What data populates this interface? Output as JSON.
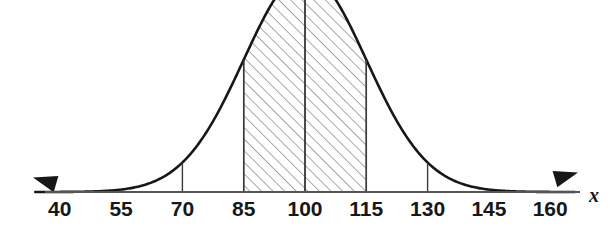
{
  "figure": {
    "kind": "normal-distribution-curve",
    "axis_label": "x",
    "colors": {
      "curve": "#171717",
      "axis": "#555555",
      "tick": "#3a3a3a",
      "hatch": "#9a9a9a",
      "shade_fill": "#ffffff",
      "background": "#ffffff"
    }
  },
  "chart_data": {
    "type": "line",
    "title": "",
    "subtitle": "",
    "xlabel": "x",
    "ylabel": "",
    "grid": false,
    "legend": null,
    "distribution": {
      "name": "normal",
      "mean": 100,
      "std_dev": 15
    },
    "xlim": [
      40,
      160
    ],
    "ylim": [
      0,
      1
    ],
    "x_ticks": [
      40,
      55,
      70,
      85,
      100,
      115,
      130,
      145,
      160
    ],
    "tick_labels": [
      "40",
      "55",
      "70",
      "85",
      "100",
      "115",
      "130",
      "145",
      "160"
    ],
    "tick_step": 15,
    "tick_drop_lines": [
      40,
      55,
      70,
      85,
      100,
      115,
      130,
      145,
      160
    ],
    "shaded_regions": [
      {
        "from": 85,
        "to": 100,
        "hatched": true
      },
      {
        "from": 100,
        "to": 115,
        "hatched": true
      }
    ],
    "shaded_span": {
      "from": 85,
      "to": 115
    },
    "interior_divider_x": 100,
    "curve_peak_cropped_top": true,
    "arrows": [
      "left",
      "right"
    ],
    "x": [
      40,
      45,
      50,
      55,
      60,
      65,
      70,
      75,
      80,
      85,
      90,
      95,
      100,
      105,
      110,
      115,
      120,
      125,
      130,
      135,
      140,
      145,
      150,
      155,
      160
    ],
    "y": [
      0.000335,
      0.000873,
      0.002187,
      0.005261,
      0.012155,
      0.026995,
      0.057606,
      0.118073,
      0.232746,
      0.411112,
      0.64118,
      0.945959,
      1.0,
      0.945959,
      0.64118,
      0.411112,
      0.232746,
      0.118073,
      0.057606,
      0.026995,
      0.012155,
      0.005261,
      0.002187,
      0.000873,
      0.000335
    ]
  }
}
